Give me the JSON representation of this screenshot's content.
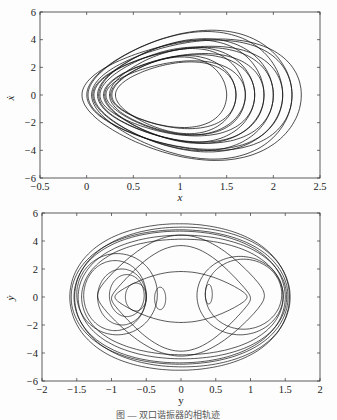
{
  "caption": "图 — 双口谐振器的相轨迹",
  "chart_data": [
    {
      "type": "line",
      "title": "",
      "xlabel": "x",
      "ylabel": "ẋ",
      "xlim": [
        -0.5,
        2.5
      ],
      "ylim": [
        -6,
        6
      ],
      "xticks": [
        "-0.5",
        "0",
        "0.5",
        "1",
        "1.5",
        "2",
        "2.5"
      ],
      "yticks": [
        "-6",
        "-4",
        "-2",
        "0",
        "2",
        "4",
        "6"
      ],
      "grid": false,
      "description": "Phase trajectory: nested closed orbits, leftmost near x=-0.05, rightmost near x=2.3, ẋ range about -5.3 to 5.4",
      "series": [
        {
          "name": "orbit-outer",
          "x_range": [
            -0.05,
            2.3
          ],
          "y_range": [
            -5.3,
            5.4
          ]
        },
        {
          "name": "orbit-inner",
          "x_range": [
            0.25,
            1.55
          ],
          "y_range": [
            -2.2,
            3.0
          ]
        }
      ]
    },
    {
      "type": "line",
      "title": "",
      "xlabel": "y",
      "ylabel": "ẏ",
      "xlim": [
        -2,
        2
      ],
      "ylim": [
        -6,
        6
      ],
      "xticks": [
        "-2",
        "-1.5",
        "-1",
        "-0.5",
        "0",
        "0.5",
        "1",
        "1.5",
        "2"
      ],
      "yticks": [
        "-6",
        "-4",
        "-2",
        "0",
        "2",
        "4",
        "6"
      ],
      "grid": false,
      "description": "Phase trajectory of y: outer ellipse y∈[-1.55,1.6], ẏ∈[-5.3,5.5]; inner loops centered near y=-0.9 and y=0.8",
      "series": [
        {
          "name": "orbit-outer",
          "x_range": [
            -1.55,
            1.6
          ],
          "y_range": [
            -5.3,
            5.5
          ]
        },
        {
          "name": "left-loops",
          "x_range": [
            -1.5,
            -0.3
          ],
          "y_range": [
            -2.6,
            3.2
          ]
        },
        {
          "name": "right-loops",
          "x_range": [
            0.35,
            1.6
          ],
          "y_range": [
            -2.8,
            3.4
          ]
        }
      ]
    }
  ]
}
